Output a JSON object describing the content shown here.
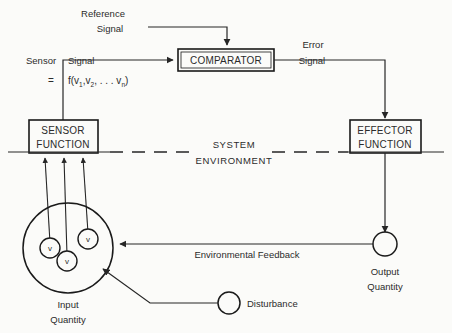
{
  "diagram": {
    "background_color": "#fbfbf9",
    "line_color": "#262626",
    "blocks": {
      "comparator": {
        "label": "COMPARATOR"
      },
      "sensor_function": {
        "line1": "SENSOR",
        "line2": "FUNCTION"
      },
      "effector_function": {
        "line1": "EFFECTOR",
        "line2": "FUNCTION"
      }
    },
    "labels": {
      "reference_signal_line1": "Reference",
      "reference_signal_line2": "Signal",
      "error_signal_line1": "Error",
      "error_signal_line2": "Signal",
      "sensor_word": "Sensor",
      "signal_word": "Signal",
      "system_environment_line1": "SYSTEM",
      "system_environment_line2": "ENVIRONMENT",
      "environmental_feedback": "Environmental Feedback",
      "input_quantity_line1": "Input",
      "input_quantity_line2": "Quantity",
      "output_quantity_line1": "Output",
      "output_quantity_line2": "Quantity",
      "disturbance": "Disturbance"
    },
    "formula": {
      "equals": "=",
      "fn": "f(v",
      "sub1": "1",
      "comma1": ",v",
      "sub2": "2",
      "dots": ", . . . v",
      "subn": "n",
      "close": ")"
    },
    "variable_nodes": [
      {
        "label": "v"
      },
      {
        "label": "v"
      },
      {
        "label": "v"
      }
    ]
  }
}
